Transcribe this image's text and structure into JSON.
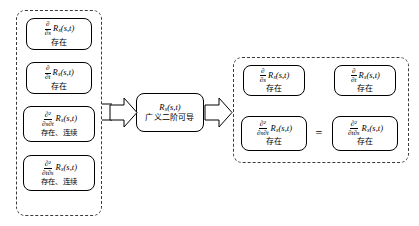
{
  "figure": {
    "type": "flow-diagram",
    "title": ""
  },
  "left_group": {
    "border_style": "dashed",
    "nodes": [
      {
        "id": "node-ds",
        "frac_num": "∂",
        "frac_den": "∂s",
        "func": "R",
        "sub": "x",
        "args": "(s,t)",
        "status": "存在"
      },
      {
        "id": "node-dt",
        "frac_num": "∂",
        "frac_den": "∂t",
        "func": "R",
        "sub": "x",
        "args": "(s,t)",
        "status": "存在"
      },
      {
        "id": "node-dsdt",
        "frac_num": "∂²",
        "frac_den": "∂s∂t",
        "func": "R",
        "sub": "x",
        "args": "(s,t)",
        "status": "存在、连续"
      },
      {
        "id": "node-dtds",
        "frac_num": "∂²",
        "frac_den": "∂t∂s",
        "func": "R",
        "sub": "x",
        "args": "(s,t)",
        "status": "存在、连续"
      }
    ]
  },
  "center_node": {
    "id": "node-center",
    "func": "R",
    "sub": "x",
    "args": "(s,t)",
    "status": "广义二阶可导"
  },
  "right_group": {
    "border_style": "dashed",
    "equals_symbol": "=",
    "nodes": [
      {
        "id": "node-r-ds",
        "frac_num": "∂",
        "frac_den": "∂s",
        "func": "R",
        "sub": "x",
        "args": "(s,t)",
        "status": "存在"
      },
      {
        "id": "node-r-dt",
        "frac_num": "∂",
        "frac_den": "∂t",
        "func": "R",
        "sub": "x",
        "args": "(s,t)",
        "status": "存在"
      },
      {
        "id": "node-r-dsdt",
        "frac_num": "∂²",
        "frac_den": "∂s∂t",
        "func": "R",
        "sub": "x",
        "args": "(s,t)",
        "status": "存在"
      },
      {
        "id": "node-r-dtds",
        "frac_num": "∂²",
        "frac_den": "∂t∂s",
        "func": "R",
        "sub": "x",
        "args": "(s,t)",
        "status": "存在"
      }
    ]
  },
  "connectors": {
    "arrow_left": "block-arrow-right",
    "arrow_right": "block-arrow-right"
  },
  "colors": {
    "stroke": "#000000",
    "dashed_stroke": "#3a3a3a",
    "background": "#ffffff"
  }
}
